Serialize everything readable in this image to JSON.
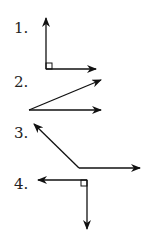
{
  "figures": [
    {
      "label": "1.",
      "type": "right-angle",
      "vertex": [
        46,
        69
      ],
      "rays": [
        [
          46,
          17
        ],
        [
          96,
          69
        ]
      ],
      "right_angle_marker": true
    },
    {
      "label": "2.",
      "type": "acute-angle",
      "vertex": [
        29,
        110
      ],
      "rays": [
        [
          101,
          80
        ],
        [
          101,
          110
        ]
      ],
      "right_angle_marker": false
    },
    {
      "label": "3.",
      "type": "obtuse-angle",
      "vertex": [
        79,
        168
      ],
      "rays": [
        [
          33,
          123
        ],
        [
          140,
          168
        ]
      ],
      "right_angle_marker": false
    },
    {
      "label": "4.",
      "type": "right-angle",
      "vertex": [
        87,
        180
      ],
      "rays": [
        [
          38,
          180
        ],
        [
          87,
          229
        ]
      ],
      "right_angle_marker": true
    }
  ],
  "colors": {
    "line": "#111111",
    "text": "#222222",
    "background": "#ffffff"
  }
}
